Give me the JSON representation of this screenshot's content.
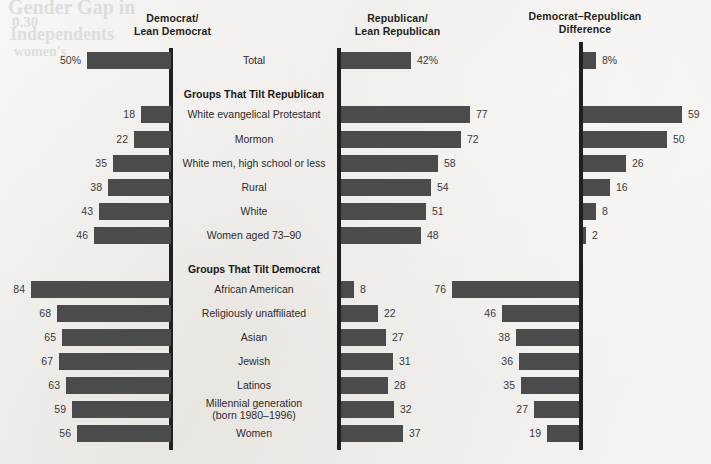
{
  "headers": {
    "democrat": "Democrat/\nLean Democrat",
    "democrat_line1": "Democrat/",
    "democrat_line2": "Lean Democrat",
    "republican_line1": "Republican/",
    "republican_line2": "Lean Republican",
    "difference_line1": "Democrat–Republican",
    "difference_line2": "Difference"
  },
  "background_texts": [
    {
      "text": "Gender Gap in",
      "x": 8,
      "y": -4,
      "size": 20,
      "weight": "bold"
    },
    {
      "text": "0.30",
      "x": 12,
      "y": 14,
      "size": 15,
      "weight": "bold"
    },
    {
      "text": "Independents",
      "x": 10,
      "y": 24,
      "size": 18,
      "weight": "bold"
    },
    {
      "text": "women's",
      "x": 14,
      "y": 44,
      "size": 14,
      "weight": "bold"
    }
  ],
  "colors": {
    "bar": "#4b4b4b",
    "axis": "#231f20",
    "background": "#efedea",
    "text": "#2e2a28"
  },
  "chart_data": {
    "type": "bar",
    "xlabel": "",
    "ylabel": "",
    "grid": false,
    "legend_position": "none",
    "orientation": "horizontal",
    "axis_scale_px_per_unit": 1.67,
    "xlim": [
      0,
      90
    ],
    "series": [
      {
        "name": "Democrat/Lean Democrat",
        "direction": "left"
      },
      {
        "name": "Republican/Lean Republican",
        "direction": "right"
      },
      {
        "name": "Democrat–Republican Difference",
        "direction": "right"
      }
    ],
    "rows": [
      {
        "kind": "data",
        "label": "Total",
        "label_lines": [
          "Total"
        ],
        "democrat": 50,
        "democrat_display": "50%",
        "republican": 42,
        "republican_display": "42%",
        "difference": 8,
        "difference_display": "8%",
        "difference_sign": "republican",
        "y": 52
      },
      {
        "kind": "section",
        "label": "Groups That Tilt Republican",
        "y": 88
      },
      {
        "kind": "data",
        "label": "White evangelical Protestant",
        "label_lines": [
          "White evangelical Protestant"
        ],
        "democrat": 18,
        "democrat_display": "18",
        "republican": 77,
        "republican_display": "77",
        "difference": 59,
        "difference_display": "59",
        "difference_sign": "republican",
        "y": 106
      },
      {
        "kind": "data",
        "label": "Mormon",
        "label_lines": [
          "Mormon"
        ],
        "democrat": 22,
        "democrat_display": "22",
        "republican": 72,
        "republican_display": "72",
        "difference": 50,
        "difference_display": "50",
        "difference_sign": "republican",
        "y": 131
      },
      {
        "kind": "data",
        "label": "White men, high school or less",
        "label_lines": [
          "White men, high school or less"
        ],
        "democrat": 35,
        "democrat_display": "35",
        "republican": 58,
        "republican_display": "58",
        "difference": 26,
        "difference_display": "26",
        "difference_sign": "republican",
        "y": 155
      },
      {
        "kind": "data",
        "label": "Rural",
        "label_lines": [
          "Rural"
        ],
        "democrat": 38,
        "democrat_display": "38",
        "republican": 54,
        "republican_display": "54",
        "difference": 16,
        "difference_display": "16",
        "difference_sign": "republican",
        "y": 179
      },
      {
        "kind": "data",
        "label": "White",
        "label_lines": [
          "White"
        ],
        "democrat": 43,
        "democrat_display": "43",
        "republican": 51,
        "republican_display": "51",
        "difference": 8,
        "difference_display": "8",
        "difference_sign": "republican",
        "y": 203
      },
      {
        "kind": "data",
        "label": "Women aged 73–90",
        "label_lines": [
          "Women aged 73–90"
        ],
        "democrat": 46,
        "democrat_display": "46",
        "republican": 48,
        "republican_display": "48",
        "difference": 2,
        "difference_display": "2",
        "difference_sign": "republican",
        "y": 227
      },
      {
        "kind": "section",
        "label": "Groups That Tilt Democrat",
        "y": 263
      },
      {
        "kind": "data",
        "label": "African American",
        "label_lines": [
          "African American"
        ],
        "democrat": 84,
        "democrat_display": "84",
        "republican": 8,
        "republican_display": "8",
        "difference": 76,
        "difference_display": "76",
        "difference_sign": "democrat",
        "y": 281
      },
      {
        "kind": "data",
        "label": "Religiously unaffiliated",
        "label_lines": [
          "Religiously unaffiliated"
        ],
        "democrat": 68,
        "democrat_display": "68",
        "republican": 22,
        "republican_display": "22",
        "difference": 46,
        "difference_display": "46",
        "difference_sign": "democrat",
        "y": 305
      },
      {
        "kind": "data",
        "label": "Asian",
        "label_lines": [
          "Asian"
        ],
        "democrat": 65,
        "democrat_display": "65",
        "republican": 27,
        "republican_display": "27",
        "difference": 38,
        "difference_display": "38",
        "difference_sign": "democrat",
        "y": 329
      },
      {
        "kind": "data",
        "label": "Jewish",
        "label_lines": [
          "Jewish"
        ],
        "democrat": 67,
        "democrat_display": "67",
        "republican": 31,
        "republican_display": "31",
        "difference": 36,
        "difference_display": "36",
        "difference_sign": "democrat",
        "y": 353
      },
      {
        "kind": "data",
        "label": "Latinos",
        "label_lines": [
          "Latinos"
        ],
        "democrat": 63,
        "democrat_display": "63",
        "republican": 28,
        "republican_display": "28",
        "difference": 35,
        "difference_display": "35",
        "difference_sign": "democrat",
        "y": 377
      },
      {
        "kind": "data",
        "label": "Millennial generation (born 1980–1996)",
        "label_lines": [
          "Millennial generation",
          "(born 1980–1996)"
        ],
        "democrat": 59,
        "democrat_display": "59",
        "republican": 32,
        "republican_display": "32",
        "difference": 27,
        "difference_display": "27",
        "difference_sign": "democrat",
        "y": 401
      },
      {
        "kind": "data",
        "label": "Women",
        "label_lines": [
          "Women"
        ],
        "democrat": 56,
        "democrat_display": "56",
        "republican": 37,
        "republican_display": "37",
        "difference": 19,
        "difference_display": "19",
        "difference_sign": "democrat",
        "y": 425
      }
    ]
  }
}
